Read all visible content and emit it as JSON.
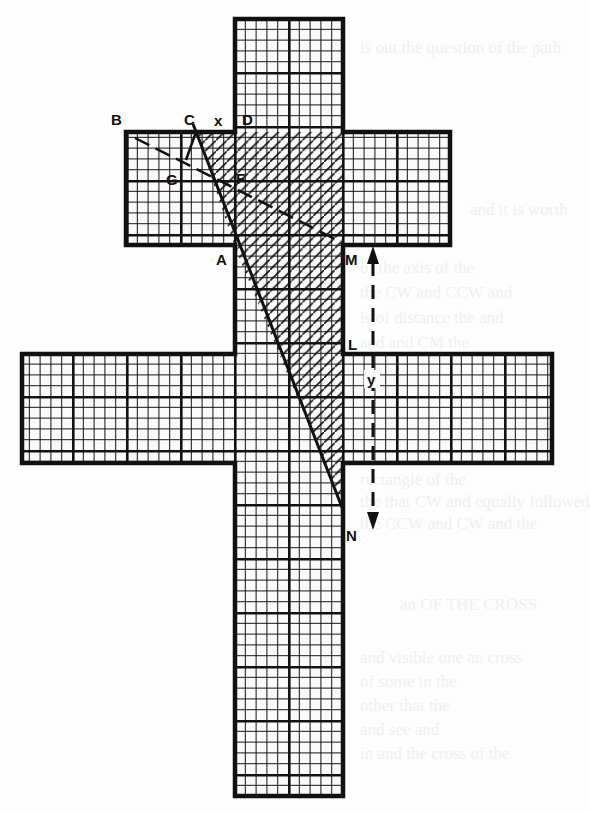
{
  "figure": {
    "type": "geometric-diagram",
    "colors": {
      "ink": "#111111",
      "paper": "#fdfdfd"
    },
    "grid": {
      "major_cell_px": 54,
      "minor_per_major": 5
    },
    "labels": {
      "B": "B",
      "C": "C",
      "x": "x",
      "D": "D",
      "G": "G",
      "F": "F",
      "A": "A",
      "M": "M",
      "L": "L",
      "y": "y",
      "N": "N"
    }
  },
  "bleed_through_text": [
    "is out the question of the path",
    "and it is worth",
    "of the axis of the",
    "the CW and CCW and",
    "is of distance the and",
    "and and CM the",
    "rectangle of the",
    "the that CW and equally followed",
    "the CCW and CW and the",
    "an OF THE CROSS",
    "and visible one an cross",
    "of some in the",
    "other that the",
    "and see and",
    "in and the cross of the"
  ]
}
